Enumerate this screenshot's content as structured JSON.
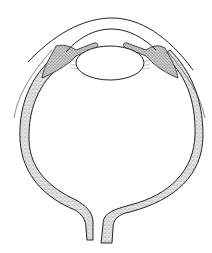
{
  "figure": {
    "line_color": "#222222",
    "stipple_color": "#8a8a8a",
    "background": "#ffffff"
  }
}
